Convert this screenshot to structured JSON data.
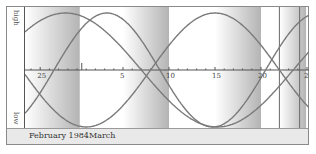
{
  "chart_data": {
    "type": "line",
    "xlabel": "",
    "ylabel_top": "high",
    "ylabel_bottom": "low",
    "ylim": [
      -1,
      1
    ],
    "x_range_days": {
      "start": "1984-02-24",
      "end": "1984-03-26"
    },
    "x_tick_labels": [
      "25",
      "5",
      "10",
      "15",
      "20",
      "25"
    ],
    "x_tick_positions_day_index": [
      1,
      10,
      15,
      20,
      25,
      30
    ],
    "series": [
      {
        "name": "physical",
        "period_days": 23,
        "phase_day": 2.5,
        "color": "#7a7a7a"
      },
      {
        "name": "emotional",
        "period_days": 28,
        "phase_day": 13.0,
        "color": "#7a7a7a"
      },
      {
        "name": "intellectual",
        "period_days": 33,
        "phase_day": -4.5,
        "color": "#7a7a7a"
      }
    ],
    "shaded_bands_day_index": [
      [
        0,
        5.3
      ],
      [
        10,
        15
      ],
      [
        20,
        25
      ],
      [
        27,
        29.9
      ]
    ],
    "marker_lines_day_index": [
      27,
      29.2
    ],
    "grid": false,
    "legend": "none"
  },
  "side": {
    "high": "high",
    "low": "low"
  },
  "footer": {
    "month1": "February 1984",
    "month2": "March"
  },
  "colors": {
    "curve": "#7a7a7a",
    "axis": "#555555",
    "band_dark": "#bdbdbd",
    "band_light": "#ffffff",
    "footer_bg": "#e9e9e9"
  }
}
